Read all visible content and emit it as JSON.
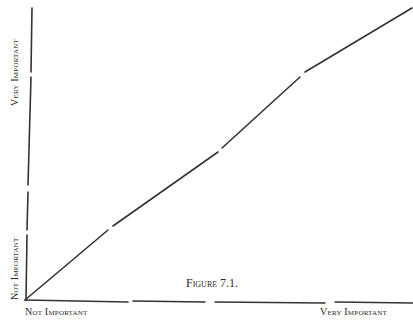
{
  "figure": {
    "caption": "Figure 7.1.",
    "x_axis": {
      "low_label": "Not Important",
      "high_label": "Very Important"
    },
    "y_axis": {
      "low_label": "Not Important",
      "high_label": "Very Important"
    },
    "line_color": "#333333"
  }
}
